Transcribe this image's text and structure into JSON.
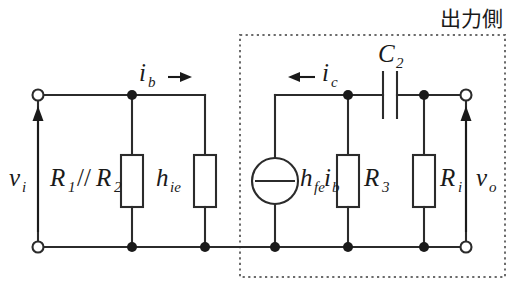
{
  "figure": {
    "title": "出力側",
    "kind": "small-signal-equivalent-circuit",
    "colors": {
      "wire": "#2b2b2b",
      "label": "#1a1a1a",
      "dotted_box": "#6b6b6b",
      "background": "#ffffff"
    }
  },
  "labels": {
    "vi": "v",
    "vi_sub": "i",
    "vo": "v",
    "vo_sub": "o",
    "r1r2": "R",
    "r1_sub": "1",
    "parallel_symbol": "//",
    "r2": "R",
    "r2_sub": "2",
    "hie": "h",
    "hie_sub": "ie",
    "ib": "i",
    "ib_sub": "b",
    "ic": "i",
    "ic_sub": "c",
    "hfe": "h",
    "hfe_sub": "fe",
    "hfe_current": "i",
    "hfe_current_sub": "b",
    "r3": "R",
    "r3_sub": "3",
    "ri": "R",
    "ri_sub": "i",
    "c2": "C",
    "c2_sub": "2"
  },
  "components": [
    {
      "name": "input-voltage-source-port",
      "label": "v_i",
      "type": "port"
    },
    {
      "name": "bias-resistor-parallel",
      "label": "R_1 // R_2",
      "type": "resistor"
    },
    {
      "name": "input-resistance-hie",
      "label": "h_ie",
      "type": "resistor"
    },
    {
      "name": "dependent-current-source",
      "label": "h_fe i_b",
      "type": "current-source"
    },
    {
      "name": "collector-resistor-r3",
      "label": "R_3",
      "type": "resistor"
    },
    {
      "name": "load-resistor-ri",
      "label": "R_i",
      "type": "resistor"
    },
    {
      "name": "coupling-capacitor-c2",
      "label": "C_2",
      "type": "capacitor"
    },
    {
      "name": "output-voltage-port",
      "label": "v_o",
      "type": "port"
    }
  ],
  "currents": [
    {
      "name": "base-current",
      "label": "i_b",
      "direction": "right"
    },
    {
      "name": "collector-current",
      "label": "i_c",
      "direction": "left"
    }
  ]
}
